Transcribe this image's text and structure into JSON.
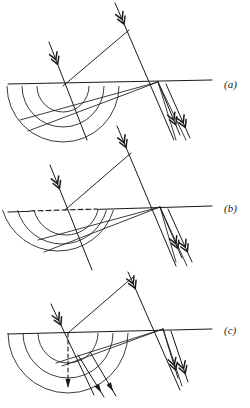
{
  "figure": {
    "type": "optics-huygens-construction",
    "background": "#ffffff",
    "ink": "#1a1a1a",
    "width": 250,
    "height": 408,
    "panels": [
      {
        "id": "a",
        "label": "(a)",
        "label_x": 224,
        "label_y": 88,
        "baseline": {
          "x1": 8,
          "y1": 84,
          "x2": 212,
          "y2": 80
        },
        "baseline_dashed_segment": null,
        "interface_point_left": {
          "x": 63,
          "y": 86
        },
        "interface_point_right": {
          "x": 158,
          "y": 82
        },
        "wavefront": {
          "x1": 63,
          "y1": 86,
          "x2": 129,
          "y2": 30
        },
        "incident_rays": [
          {
            "x1": 49,
            "y1": 42,
            "x2": 87,
            "y2": 140,
            "head_t": 0.18
          },
          {
            "x1": 115,
            "y1": 3,
            "x2": 174,
            "y2": 140,
            "head_t": 0.12
          }
        ],
        "arcs": [
          {
            "cx": 63,
            "cy": 86,
            "r": 56
          },
          {
            "cx": 63,
            "cy": 86,
            "r": 41
          },
          {
            "cx": 63,
            "cy": 86,
            "r": 26
          }
        ],
        "arc_style": "semicircle-below",
        "refracted_rays": [
          {
            "x1": 158,
            "y1": 82,
            "x2": 20,
            "y2": 120
          },
          {
            "x1": 158,
            "y1": 82,
            "x2": 28,
            "y2": 131
          },
          {
            "x1": 158,
            "y1": 82,
            "x2": 176,
            "y2": 140
          },
          {
            "x1": 158,
            "y1": 82,
            "x2": 186,
            "y2": 140
          }
        ],
        "outgoing_arrow_rays": [
          {
            "x1": 158,
            "y1": 82,
            "x2": 180,
            "y2": 135,
            "head_t": 0.72
          },
          {
            "x1": 166,
            "y1": 84,
            "x2": 190,
            "y2": 138,
            "head_t": 0.72
          }
        ]
      },
      {
        "id": "b",
        "label": "(b)",
        "label_x": 224,
        "label_y": 212,
        "baseline": {
          "x1": 8,
          "y1": 212,
          "x2": 212,
          "y2": 206
        },
        "baseline_dashed_segment": {
          "x1": 30,
          "y1": 211,
          "x2": 97,
          "y2": 209
        },
        "interface_point_left": {
          "x": 65,
          "y": 210
        },
        "interface_point_right": {
          "x": 160,
          "y": 207
        },
        "wavefront": {
          "x1": 65,
          "y1": 210,
          "x2": 131,
          "y2": 153
        },
        "incident_rays": [
          {
            "x1": 50,
            "y1": 165,
            "x2": 92,
            "y2": 270,
            "head_t": 0.18
          },
          {
            "x1": 117,
            "y1": 126,
            "x2": 176,
            "y2": 266,
            "head_t": 0.12
          }
        ],
        "arcs": [
          {
            "cx": 58,
            "cy": 193,
            "r": 58
          },
          {
            "cx": 62,
            "cy": 198,
            "r": 46
          },
          {
            "cx": 66,
            "cy": 202,
            "r": 33
          }
        ],
        "arc_style": "offset-below",
        "refracted_rays": [
          {
            "x1": 160,
            "y1": 207,
            "x2": 38,
            "y2": 240
          },
          {
            "x1": 160,
            "y1": 207,
            "x2": 44,
            "y2": 252
          },
          {
            "x1": 160,
            "y1": 207,
            "x2": 176,
            "y2": 262
          },
          {
            "x1": 160,
            "y1": 207,
            "x2": 187,
            "y2": 266
          }
        ],
        "outgoing_arrow_rays": [
          {
            "x1": 160,
            "y1": 207,
            "x2": 182,
            "y2": 258,
            "head_t": 0.72
          },
          {
            "x1": 168,
            "y1": 209,
            "x2": 192,
            "y2": 262,
            "head_t": 0.72
          }
        ]
      },
      {
        "id": "c",
        "label": "(c)",
        "label_x": 224,
        "label_y": 334,
        "baseline": {
          "x1": 8,
          "y1": 334,
          "x2": 212,
          "y2": 329
        },
        "baseline_dashed_segment": null,
        "interface_point_left": {
          "x": 68,
          "y": 333
        },
        "interface_point_right": {
          "x": 163,
          "y": 329
        },
        "wavefront": {
          "x1": 68,
          "y1": 333,
          "x2": 133,
          "y2": 277
        },
        "incident_rays": [
          {
            "x1": 51,
            "y1": 304,
            "x2": 94,
            "y2": 395,
            "head_t": 0.18
          },
          {
            "x1": 128,
            "y1": 272,
            "x2": 180,
            "y2": 390,
            "head_t": 0.1
          }
        ],
        "arcs": [
          {
            "cx": 68,
            "cy": 333,
            "r": 60
          },
          {
            "cx": 68,
            "cy": 333,
            "r": 45
          },
          {
            "cx": 68,
            "cy": 333,
            "r": 30
          }
        ],
        "arc_style": "semicircle-below",
        "dashed_normal": {
          "x1": 68,
          "y1": 333,
          "x2": 68,
          "y2": 389,
          "head_t": 1.0
        },
        "refracted_rays": [
          {
            "x1": 163,
            "y1": 329,
            "x2": 56,
            "y2": 363
          },
          {
            "x1": 163,
            "y1": 329,
            "x2": 62,
            "y2": 366
          },
          {
            "x1": 163,
            "y1": 329,
            "x2": 182,
            "y2": 386
          }
        ],
        "outgoing_arrow_rays": [
          {
            "x1": 163,
            "y1": 329,
            "x2": 178,
            "y2": 378,
            "head_t": 0.74
          },
          {
            "x1": 171,
            "y1": 331,
            "x2": 188,
            "y2": 382,
            "head_t": 0.74
          }
        ],
        "lower_arrow_rays": [
          {
            "x1": 78,
            "y1": 355,
            "x2": 104,
            "y2": 397,
            "head_t": 0.8
          },
          {
            "x1": 90,
            "y1": 352,
            "x2": 116,
            "y2": 396,
            "head_t": 0.8
          }
        ]
      }
    ]
  }
}
